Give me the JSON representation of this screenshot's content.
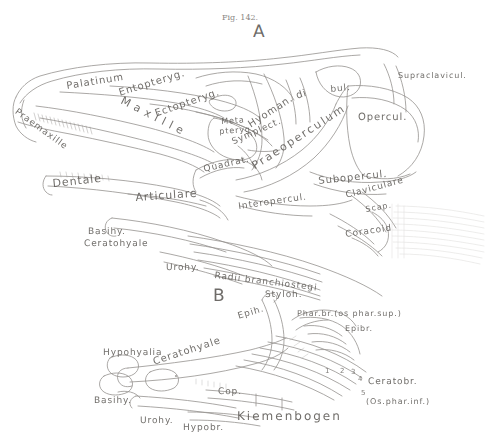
{
  "plate": {
    "caption": "Fig. 142.",
    "panel_a_label": "A",
    "panel_b_label": "B",
    "background": "#ffffff",
    "ink_color": "#5d5a56"
  },
  "panel_a": {
    "title": "A",
    "labels": [
      {
        "text": "Praemaxille",
        "x": 18,
        "y": 108,
        "size": 9,
        "rot": 36
      },
      {
        "text": "Maxille",
        "x": 124,
        "y": 95,
        "size": 11,
        "rot": 27,
        "spread": 5
      },
      {
        "text": "Palatinum",
        "x": 66,
        "y": 82,
        "size": 10,
        "rot": -9
      },
      {
        "text": "Entopteryg.",
        "x": 118,
        "y": 89,
        "size": 10,
        "rot": -17
      },
      {
        "text": "Ectopteryg.",
        "x": 154,
        "y": 110,
        "size": 10,
        "rot": -19
      },
      {
        "text": "Meta",
        "x": 221,
        "y": 118,
        "size": 8,
        "rot": -4
      },
      {
        "text": "pteryg.",
        "x": 219,
        "y": 128,
        "size": 8,
        "rot": -4
      },
      {
        "text": "Hyoman.",
        "x": 247,
        "y": 122,
        "size": 10,
        "rot": -33
      },
      {
        "text": "Symplect.",
        "x": 231,
        "y": 139,
        "size": 9,
        "rot": -24
      },
      {
        "text": "Quadrat.",
        "x": 203,
        "y": 166,
        "size": 9,
        "rot": -13
      },
      {
        "text": "di",
        "x": 295,
        "y": 92,
        "size": 10,
        "rot": -18
      },
      {
        "text": "bul.",
        "x": 330,
        "y": 86,
        "size": 9,
        "rot": -6
      },
      {
        "text": "Praeoperculum",
        "x": 250,
        "y": 162,
        "size": 11,
        "rot": -33,
        "spread": 2
      },
      {
        "text": "Opercul.",
        "x": 358,
        "y": 113,
        "size": 10,
        "rot": 0
      },
      {
        "text": "Supraclavicul.",
        "x": 398,
        "y": 72,
        "size": 8,
        "rot": 0
      },
      {
        "text": "Subopercul.",
        "x": 318,
        "y": 177,
        "size": 10,
        "rot": -6
      },
      {
        "text": "Claviculare",
        "x": 345,
        "y": 192,
        "size": 9,
        "rot": -15
      },
      {
        "text": "Scap.",
        "x": 365,
        "y": 206,
        "size": 8,
        "rot": -10
      },
      {
        "text": "Coracoid",
        "x": 345,
        "y": 231,
        "size": 9,
        "rot": -8
      },
      {
        "text": "Interopercul.",
        "x": 238,
        "y": 203,
        "size": 9,
        "rot": -8
      },
      {
        "text": "Dentale",
        "x": 52,
        "y": 178,
        "size": 11,
        "rot": -6
      },
      {
        "text": "Articulare",
        "x": 135,
        "y": 192,
        "size": 11,
        "rot": -4
      },
      {
        "text": "Basihy.",
        "x": 88,
        "y": 228,
        "size": 9,
        "rot": 0
      },
      {
        "text": "Ceratohyale",
        "x": 84,
        "y": 240,
        "size": 9,
        "rot": 0
      },
      {
        "text": "Urohy.",
        "x": 166,
        "y": 264,
        "size": 9,
        "rot": 0
      },
      {
        "text": "Radii branchiostegi",
        "x": 215,
        "y": 272,
        "size": 9,
        "rot": 7
      }
    ]
  },
  "panel_b": {
    "title": "B",
    "labels": [
      {
        "text": "Styloh.",
        "x": 265,
        "y": 291,
        "size": 9,
        "rot": 0
      },
      {
        "text": "Epih.",
        "x": 237,
        "y": 313,
        "size": 9,
        "rot": -17
      },
      {
        "text": "Phar.br.(os phar.sup.)",
        "x": 297,
        "y": 310,
        "size": 8,
        "rot": 0
      },
      {
        "text": "Epibr.",
        "x": 345,
        "y": 325,
        "size": 8,
        "rot": 0
      },
      {
        "text": "Hypohyalia",
        "x": 103,
        "y": 349,
        "size": 9,
        "rot": 0
      },
      {
        "text": "Ceratohyale",
        "x": 152,
        "y": 358,
        "size": 10,
        "rot": -18
      },
      {
        "text": "Basihy.",
        "x": 94,
        "y": 397,
        "size": 9,
        "rot": 0
      },
      {
        "text": "Urohy.",
        "x": 140,
        "y": 417,
        "size": 9,
        "rot": 0
      },
      {
        "text": "Cop.",
        "x": 218,
        "y": 388,
        "size": 9,
        "rot": 0
      },
      {
        "text": "Hypobr.",
        "x": 183,
        "y": 424,
        "size": 9,
        "rot": 0
      },
      {
        "text": "Kiemenbogen",
        "x": 237,
        "y": 410,
        "size": 12,
        "rot": 0,
        "spread": 2
      },
      {
        "text": "Ceratobr.",
        "x": 368,
        "y": 378,
        "size": 9,
        "rot": 0
      },
      {
        "text": "(Os.phar.inf.)",
        "x": 366,
        "y": 398,
        "size": 8,
        "rot": 0
      }
    ],
    "arch_numbers": [
      {
        "text": "1",
        "x": 325,
        "y": 367
      },
      {
        "text": "2",
        "x": 340,
        "y": 367
      },
      {
        "text": "3",
        "x": 351,
        "y": 368
      },
      {
        "text": "4",
        "x": 358,
        "y": 375
      },
      {
        "text": "5",
        "x": 361,
        "y": 389
      }
    ]
  }
}
